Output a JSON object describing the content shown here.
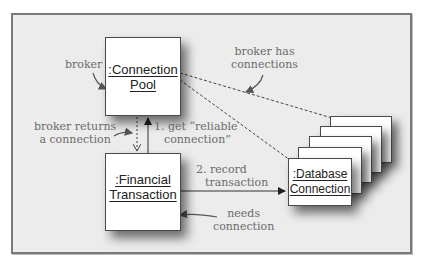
{
  "diagram": {
    "type": "UML collaboration/object diagram",
    "objects": {
      "connection_pool": {
        "line1": ":Connection",
        "line2": "Pool"
      },
      "financial_transaction": {
        "line1": ":Financial",
        "line2": "Transaction"
      },
      "database_connection": {
        "line1": ":Database",
        "line2": "Connection",
        "stack_count": 5
      }
    },
    "messages": {
      "get_reliable": {
        "line1": "1. get “reliable",
        "line2": "connection”"
      },
      "record_transaction": {
        "line1": "2. record",
        "line2": "transaction"
      }
    },
    "annotations": {
      "broker": "broker",
      "broker_returns": {
        "line1": "broker returns",
        "line2": "a connection"
      },
      "broker_has": {
        "line1": "broker has",
        "line2": "connections"
      },
      "needs_connection": {
        "line1": "needs",
        "line2": "connection"
      }
    },
    "colors": {
      "panel_bg": "#ececec",
      "panel_border": "#7a7a7a",
      "box_border": "#4a4a4a",
      "annotation_text": "#6b6b6b",
      "line": "#444444"
    }
  }
}
